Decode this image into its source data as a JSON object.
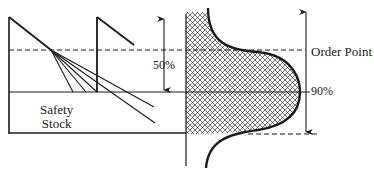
{
  "diagram": {
    "type": "inventory safety-stock / order-point diagram with demand distribution",
    "labels": {
      "safety_stock_line1": "Safety",
      "safety_stock_line2": "Stock",
      "replenish_pct": "50%",
      "order_point": "Order Point",
      "coverage_pct": "90%"
    },
    "colors": {
      "line": "#1a1a1a",
      "background": "#ffffff",
      "hatch": "#1a1a1a"
    },
    "elements": [
      "sawtooth inventory curve",
      "fan of depletion lines from order point",
      "dashed order point line",
      "safety stock level line",
      "50% double arrow",
      "cross-hatched bell-shaped demand distribution",
      "90% double arrow",
      "dashed lower bound line"
    ]
  }
}
